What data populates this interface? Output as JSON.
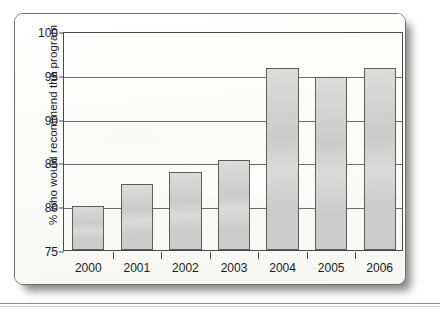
{
  "chart_data": {
    "type": "bar",
    "title": "",
    "subtitle": "",
    "xlabel": "",
    "ylabel": "% who would recommend the program",
    "categories": [
      "2000",
      "2001",
      "2002",
      "2003",
      "2004",
      "2005",
      "2006"
    ],
    "values": [
      80.0,
      82.5,
      83.9,
      85.3,
      95.8,
      94.8,
      95.8
    ],
    "series": [
      {
        "name": "% who would recommend the program",
        "values": [
          80.0,
          82.5,
          83.9,
          85.3,
          95.8,
          94.8,
          95.8
        ]
      }
    ],
    "ylim": [
      75,
      100
    ],
    "y_ticks": [
      75,
      80,
      85,
      90,
      95,
      100
    ],
    "y_tick_labels": [
      "75",
      "80",
      "85",
      "90",
      "95",
      "100"
    ],
    "grid": true,
    "grid_axis": "y",
    "legend": false,
    "legend_position": "none",
    "bar_fill_color": "#cbcbcb",
    "bar_edge_color": "#5d5d5d",
    "axis_color": "#4a4a4a",
    "background_color": "#fdfdfc"
  },
  "figure": {
    "page_background": "#fdfdfc",
    "frame_color": "#6f6f6f"
  }
}
